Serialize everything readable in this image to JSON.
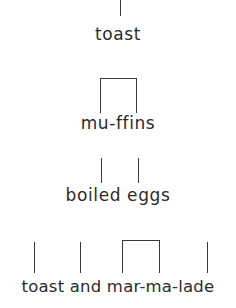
{
  "page": {
    "background_color": "#ffffff",
    "ink_color": "#2b2b2b",
    "mark_color": "#3a3a3a"
  },
  "rows": [
    {
      "id": "row-1",
      "text": "toast",
      "text_top": 24,
      "marks": [
        {
          "type": "tick",
          "name": "tick",
          "x": 120,
          "y": 0,
          "height": 16
        }
      ]
    },
    {
      "id": "row-2",
      "text": "mu-ffins",
      "text_top": 113,
      "marks": [
        {
          "type": "bracket",
          "name": "bracket",
          "x": 100,
          "y": 78,
          "width": 37,
          "height": 35
        }
      ]
    },
    {
      "id": "row-3",
      "text": "boiled eggs",
      "text_top": 185,
      "marks": [
        {
          "type": "tick",
          "name": "tick",
          "x": 101,
          "y": 158,
          "height": 25
        },
        {
          "type": "tick",
          "name": "tick",
          "x": 138,
          "y": 158,
          "height": 25
        }
      ]
    },
    {
      "id": "row-4",
      "text": "toast and mar-ma-lade",
      "text_top": 277,
      "marks": [
        {
          "type": "tick",
          "name": "tick",
          "x": 34,
          "y": 242,
          "height": 31
        },
        {
          "type": "tick",
          "name": "tick",
          "x": 80,
          "y": 242,
          "height": 31
        },
        {
          "type": "bracket",
          "name": "bracket",
          "x": 122,
          "y": 240,
          "width": 38,
          "height": 33
        },
        {
          "type": "tick",
          "name": "tick",
          "x": 207,
          "y": 242,
          "height": 31
        }
      ]
    }
  ]
}
